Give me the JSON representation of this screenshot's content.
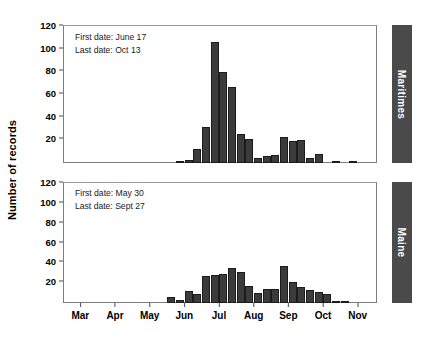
{
  "figure": {
    "ylabel": "Number of records"
  },
  "chart_data": [
    {
      "type": "bar",
      "title": "Maritimes",
      "panel": "top",
      "xlabel": "",
      "ylabel": "Number of records",
      "ylim": [
        0,
        120
      ],
      "yticks": [
        0,
        20,
        40,
        60,
        80,
        100,
        120
      ],
      "ytick_labels": [
        "",
        "20",
        "40",
        "60",
        "80",
        "100",
        "120"
      ],
      "xticks": [
        "Mar",
        "Apr",
        "May",
        "Jun",
        "Jul",
        "Aug",
        "Sep",
        "Oct",
        "Nov"
      ],
      "grid": false,
      "legend": "none",
      "annotations": [
        "First date: June 17",
        "Last date: Oct 13"
      ],
      "bar_color": "#3b3b3b",
      "bin": "week",
      "x": [
        "Mar w1",
        "Mar w2",
        "Mar w3",
        "Mar w4",
        "Apr w1",
        "Apr w2",
        "Apr w3",
        "Apr w4",
        "May w1",
        "May w2",
        "May w3",
        "May w4",
        "Jun w1",
        "Jun w2",
        "Jun w3",
        "Jun w4",
        "Jul w1",
        "Jul w2",
        "Jul w3",
        "Jul w4",
        "Aug w1",
        "Aug w2",
        "Aug w3",
        "Aug w4",
        "Sep w1",
        "Sep w2",
        "Sep w3",
        "Sep w4",
        "Oct w1",
        "Oct w2",
        "Oct w3",
        "Oct w4",
        "Nov w1",
        "Nov w2",
        "Nov w3",
        "Nov w4"
      ],
      "values": [
        0,
        0,
        0,
        0,
        0,
        0,
        0,
        0,
        0,
        0,
        0,
        0,
        0,
        2,
        3,
        12,
        32,
        107,
        80,
        67,
        26,
        21,
        4,
        6,
        7,
        23,
        19,
        20,
        4,
        8,
        0,
        2,
        0,
        2,
        0,
        0
      ]
    },
    {
      "type": "bar",
      "title": "Maine",
      "panel": "bottom",
      "xlabel": "",
      "ylabel": "Number of records",
      "ylim": [
        0,
        120
      ],
      "yticks": [
        0,
        20,
        40,
        60,
        80,
        100,
        120
      ],
      "ytick_labels": [
        "",
        "20",
        "40",
        "60",
        "80",
        "100",
        "120"
      ],
      "xticks": [
        "Mar",
        "Apr",
        "May",
        "Jun",
        "Jul",
        "Aug",
        "Sep",
        "Oct",
        "Nov"
      ],
      "grid": false,
      "legend": "none",
      "annotations": [
        "First date: May 30",
        "Last date: Sept 27"
      ],
      "bar_color": "#3b3b3b",
      "bin": "week",
      "x": [
        "Mar w1",
        "Mar w2",
        "Mar w3",
        "Mar w4",
        "Apr w1",
        "Apr w2",
        "Apr w3",
        "Apr w4",
        "May w1",
        "May w2",
        "May w3",
        "May w4",
        "Jun w1",
        "Jun w2",
        "Jun w3",
        "Jun w4",
        "Jul w1",
        "Jul w2",
        "Jul w3",
        "Jul w4",
        "Aug w1",
        "Aug w2",
        "Aug w3",
        "Aug w4",
        "Sep w1",
        "Sep w2",
        "Sep w3",
        "Sep w4",
        "Oct w1",
        "Oct w2",
        "Oct w3",
        "Oct w4",
        "Nov w1",
        "Nov w2",
        "Nov w3",
        "Nov w4"
      ],
      "values": [
        0,
        0,
        0,
        0,
        0,
        0,
        0,
        0,
        0,
        0,
        0,
        0,
        6,
        3,
        12,
        9,
        27,
        28,
        29,
        35,
        31,
        17,
        10,
        14,
        14,
        37,
        21,
        16,
        13,
        11,
        9,
        2,
        1,
        0,
        0,
        0
      ]
    }
  ]
}
